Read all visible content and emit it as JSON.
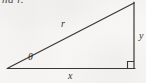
{
  "figure": {
    "clipped_text_above": "nd r.",
    "background_color": "#f7f6f4",
    "stroke_color": "#3a3835",
    "labels": {
      "hypotenuse": "r",
      "base": "x",
      "vertical": "y",
      "angle": "θ"
    },
    "geometry": {
      "left_vertex": "(8, 68)",
      "right_angle_vertex": "(134, 68)",
      "apex": "(134, 3)",
      "right_angle_marker": "square"
    }
  }
}
